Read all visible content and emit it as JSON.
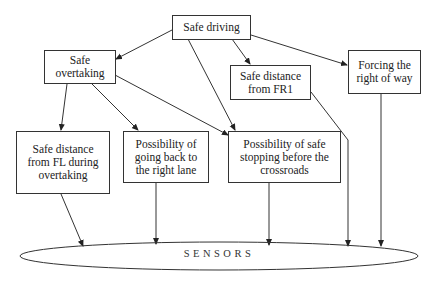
{
  "diagram": {
    "nodes": [
      {
        "id": "safe-driving",
        "label": "Safe driving"
      },
      {
        "id": "safe-overtaking",
        "label": "Safe overtaking"
      },
      {
        "id": "safe-distance-fr1",
        "label": "Safe distance from FR1"
      },
      {
        "id": "forcing-right-of-way",
        "label": "Forcing the right of way"
      },
      {
        "id": "safe-distance-fl",
        "label": "Safe distance from FL during overtaking"
      },
      {
        "id": "going-back-right-lane",
        "label": "Possibility of going back to the right lane"
      },
      {
        "id": "safe-stopping",
        "label": "Possibility of safe stopping before the crossroads"
      },
      {
        "id": "sensors",
        "label": "SENSORS"
      }
    ],
    "edges": [
      {
        "from": "safe-driving",
        "to": "safe-overtaking"
      },
      {
        "from": "safe-driving",
        "to": "safe-distance-fr1"
      },
      {
        "from": "safe-driving",
        "to": "forcing-right-of-way"
      },
      {
        "from": "safe-driving",
        "to": "safe-stopping"
      },
      {
        "from": "safe-overtaking",
        "to": "safe-distance-fl"
      },
      {
        "from": "safe-overtaking",
        "to": "going-back-right-lane"
      },
      {
        "from": "safe-overtaking",
        "to": "safe-stopping"
      },
      {
        "from": "safe-distance-fl",
        "to": "sensors"
      },
      {
        "from": "going-back-right-lane",
        "to": "sensors"
      },
      {
        "from": "safe-stopping",
        "to": "sensors"
      },
      {
        "from": "safe-distance-fr1",
        "to": "sensors"
      },
      {
        "from": "forcing-right-of-way",
        "to": "sensors"
      }
    ]
  },
  "labels": {
    "safe_driving": "Safe driving",
    "safe_overtaking": "Safe overtaking",
    "safe_distance_fr1": "Safe distance from FR1",
    "forcing_right_of_way": "Forcing the right of way",
    "safe_distance_fl": "Safe distance from FL during overtaking",
    "going_back_right_lane": "Possibility of going back to the right lane",
    "safe_stopping": "Possibility of safe stopping before the crossroads",
    "sensors": "SENSORS"
  }
}
